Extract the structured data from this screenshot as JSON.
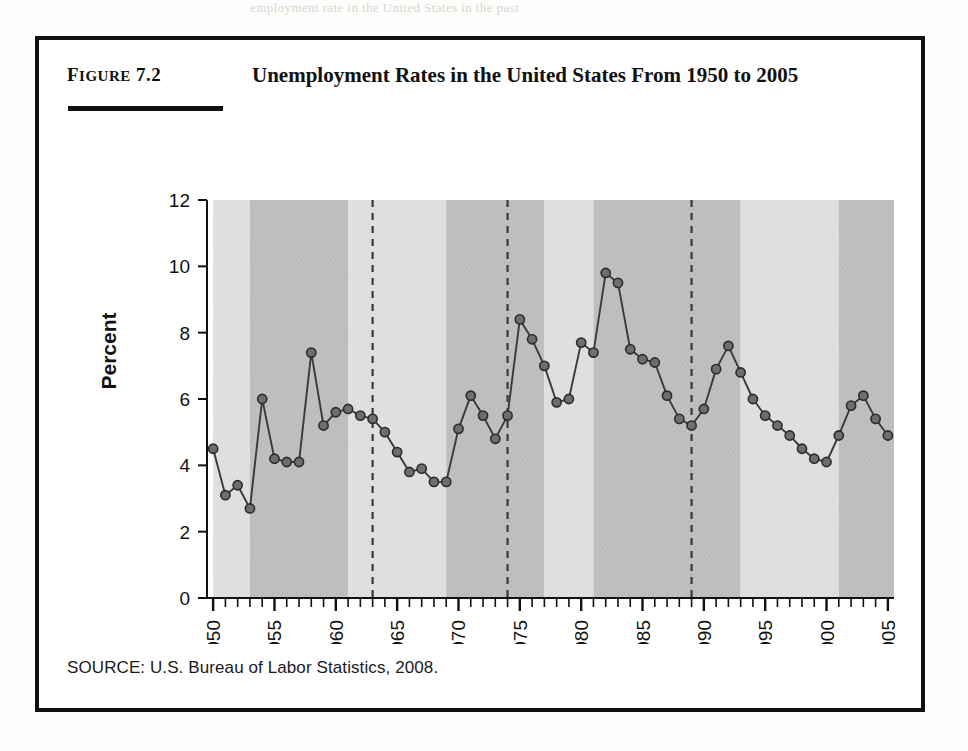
{
  "page": {
    "bleed_text": "employment rate in the United States in the past"
  },
  "figure": {
    "label_prefix": "F",
    "label_rest": "IGURE",
    "label_number": "7.2",
    "title": "Unemployment Rates in the United States From 1950 to 2005",
    "source": "SOURCE: U.S. Bureau of Labor Statistics, 2008."
  },
  "chart_data": {
    "type": "line",
    "title": "Unemployment Rates in the United States From 1950 to 2005",
    "xlabel": "",
    "ylabel": "Percent",
    "xlim": [
      1949.5,
      2005.5
    ],
    "ylim": [
      0,
      12
    ],
    "yticks": [
      0,
      2,
      4,
      6,
      8,
      10,
      12
    ],
    "xticks": [
      1950,
      1955,
      1960,
      1965,
      1970,
      1975,
      1980,
      1985,
      1990,
      1995,
      2000,
      2005
    ],
    "xtick_labels": [
      "1950",
      "1955",
      "1960",
      "1965",
      "1970",
      "1975",
      "1980",
      "1985",
      "1990",
      "1995",
      "2000",
      "2005"
    ],
    "ytick_labels": [
      "0",
      "2",
      "4",
      "6",
      "8",
      "10",
      "12"
    ],
    "grid": false,
    "legend": null,
    "marker": "filled-circle",
    "line_color": "#3a3a3a",
    "marker_color": "#6e6e6e",
    "marker_edge_color": "#2b2b2b",
    "x": [
      1950,
      1951,
      1952,
      1953,
      1954,
      1955,
      1956,
      1957,
      1958,
      1959,
      1960,
      1961,
      1962,
      1963,
      1964,
      1965,
      1966,
      1967,
      1968,
      1969,
      1970,
      1971,
      1972,
      1973,
      1974,
      1975,
      1976,
      1977,
      1978,
      1979,
      1980,
      1981,
      1982,
      1983,
      1984,
      1985,
      1986,
      1987,
      1988,
      1989,
      1990,
      1991,
      1992,
      1993,
      1994,
      1995,
      1996,
      1997,
      1998,
      1999,
      2000,
      2001,
      2002,
      2003,
      2004,
      2005
    ],
    "values": [
      4.5,
      3.1,
      3.4,
      2.7,
      6.0,
      4.2,
      4.1,
      4.1,
      7.4,
      5.2,
      5.6,
      5.7,
      5.5,
      5.4,
      5.0,
      4.4,
      3.8,
      3.9,
      3.5,
      3.5,
      5.1,
      6.1,
      5.5,
      4.8,
      5.5,
      8.4,
      7.8,
      7.0,
      5.9,
      6.0,
      7.7,
      7.4,
      9.8,
      9.5,
      7.5,
      7.2,
      7.1,
      6.1,
      5.4,
      5.2,
      5.7,
      6.9,
      7.6,
      6.8,
      6.0,
      5.5,
      5.2,
      4.9,
      4.5,
      4.2,
      4.1,
      4.9,
      5.8,
      6.1,
      5.4,
      4.9
    ],
    "bands": [
      {
        "start": 1950,
        "end": 1953,
        "shade": "light"
      },
      {
        "start": 1953,
        "end": 1961,
        "shade": "dark"
      },
      {
        "start": 1961,
        "end": 1969,
        "shade": "light"
      },
      {
        "start": 1969,
        "end": 1977,
        "shade": "dark"
      },
      {
        "start": 1977,
        "end": 1981,
        "shade": "light"
      },
      {
        "start": 1981,
        "end": 1993,
        "shade": "dark"
      },
      {
        "start": 1993,
        "end": 2001,
        "shade": "light"
      },
      {
        "start": 2001,
        "end": 2005.5,
        "shade": "dark"
      }
    ],
    "band_light_color": "#dededc",
    "band_dark_color": "#bcbcba",
    "vertical_markers": [
      1963,
      1974,
      1989
    ],
    "vertical_marker_style": "dashed",
    "vertical_marker_color": "#3a3a3a"
  }
}
